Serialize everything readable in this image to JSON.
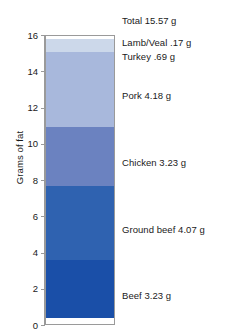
{
  "chart_data": {
    "type": "bar",
    "stacked": true,
    "orientation": "vertical",
    "title": "",
    "subtitle": "",
    "xlabel": "",
    "ylabel": "Grams of fat",
    "ylim": [
      0,
      16
    ],
    "ytick_values": [
      0,
      2,
      4,
      6,
      8,
      10,
      12,
      14,
      16
    ],
    "ytick_labels": [
      "0",
      "2",
      "4",
      "6",
      "8",
      "10",
      "12",
      "14",
      "16"
    ],
    "grid": false,
    "legend": "none",
    "categories": [
      "Meat"
    ],
    "annotations": [
      {
        "name": "total",
        "text": "Total 15.57 g",
        "value": 15.57
      }
    ],
    "series": [
      {
        "name": "Beef",
        "label": "Beef 3.23 g",
        "value": 3.23,
        "color": "#1a4fa8",
        "cumulative_bottom": 0,
        "cumulative_top": 3.23
      },
      {
        "name": "Ground beef",
        "label": "Ground beef 4.07 g",
        "value": 4.07,
        "color": "#2f62b0",
        "cumulative_bottom": 3.23,
        "cumulative_top": 7.3
      },
      {
        "name": "Chicken",
        "label": "Chicken 3.23 g",
        "value": 3.23,
        "color": "#6b82c0",
        "cumulative_bottom": 7.3,
        "cumulative_top": 10.53
      },
      {
        "name": "Pork",
        "label": "Pork 4.18 g",
        "value": 4.18,
        "color": "#a8b8dc",
        "cumulative_bottom": 10.53,
        "cumulative_top": 14.71
      },
      {
        "name": "Turkey",
        "label": "Turkey .69 g",
        "value": 0.69,
        "color": "#ccd8ea",
        "cumulative_bottom": 14.71,
        "cumulative_top": 15.4
      },
      {
        "name": "Lamb/Veal",
        "label": "Lamb/Veal .17 g",
        "value": 0.17,
        "color": "#ffffff",
        "cumulative_bottom": 15.4,
        "cumulative_top": 15.57
      }
    ]
  },
  "axis": {
    "y_title": "Grams of fat"
  },
  "labels": {
    "total": "Total 15.57 g",
    "lamb_veal": "Lamb/Veal .17 g",
    "turkey": "Turkey .69 g",
    "pork": "Pork 4.18 g",
    "chicken": "Chicken 3.23 g",
    "ground_beef": "Ground beef 4.07 g",
    "beef": "Beef 3.23 g"
  },
  "ticks": {
    "t0": "0",
    "t2": "2",
    "t4": "4",
    "t6": "6",
    "t8": "8",
    "t10": "10",
    "t12": "12",
    "t14": "14",
    "t16": "16"
  }
}
